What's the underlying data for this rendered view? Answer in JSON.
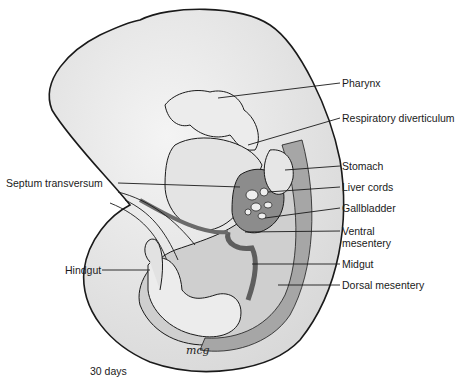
{
  "figure": {
    "caption": "30 days",
    "signature": "mcg",
    "colors": {
      "outline": "#1a1a1a",
      "body_light": "#e8e8e8",
      "body_mid": "#d6d6d6",
      "mesentery_dark": "#9a9a9a",
      "gut_dark": "#6f6f6f",
      "background": "#ffffff"
    }
  },
  "labels": {
    "pharynx": "Pharynx",
    "respiratory_diverticulum": "Respiratory diverticulum",
    "stomach": "Stomach",
    "septum_transversum": "Septum transversum",
    "liver_cords": "Liver cords",
    "gallbladder": "Gallbladder",
    "ventral_mesentery_line1": "Ventral",
    "ventral_mesentery_line2": "mesentery",
    "hindgut": "Hindgut",
    "midgut": "Midgut",
    "dorsal_mesentery": "Dorsal mesentery"
  }
}
